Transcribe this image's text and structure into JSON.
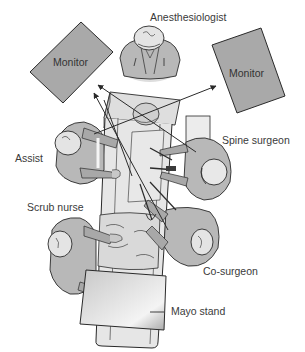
{
  "diagram": {
    "background": "#ffffff",
    "colors": {
      "monitor_fill": "#a9a9a9",
      "staff_fill": "#b8b8b8",
      "staff_dark": "#9a9a9a",
      "head_fill": "#e4e4e4",
      "table_fill": "#e6e6e6",
      "drape_fill": "#d6d6d6",
      "mayo_fill": "#cfcfcf",
      "line": "#2a2a2a",
      "text": "#3a3a3a"
    },
    "monitors": [
      {
        "id": "monitor-left",
        "label": "Monitor"
      },
      {
        "id": "monitor-right",
        "label": "Monitor"
      }
    ],
    "labels": {
      "anesthesiologist": "Anesthesiologist",
      "assist": "Assist",
      "spine_surgeon": "Spine surgeon",
      "scrub_nurse": "Scrub nurse",
      "co_surgeon": "Co-surgeon",
      "mayo_stand": "Mayo stand"
    },
    "sight_lines": [
      {
        "from": "assist",
        "to": "monitor-right"
      },
      {
        "from": "spine_surgeon",
        "to": "monitor-left"
      },
      {
        "from": "co_surgeon",
        "to": "monitor-left"
      },
      {
        "from": "scrub_nurse",
        "to": "monitor-left"
      }
    ]
  }
}
